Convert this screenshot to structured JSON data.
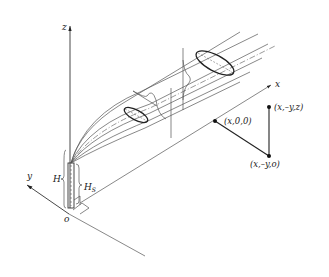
{
  "diagram": {
    "type": "gaussian-plume-dispersion-coordinate-system",
    "axes": {
      "x_label": "x",
      "y_label": "y",
      "z_label": "z",
      "origin_label": "o"
    },
    "stack": {
      "height_label": "H",
      "stack_height_label_base": "H",
      "stack_height_label_sub": "S"
    },
    "points": {
      "p1": "(x,0,0)",
      "p2": "(x,–y,z)",
      "p3": "(x,–y,o)"
    },
    "colors": {
      "line": "#333333",
      "background": "#ffffff"
    }
  }
}
